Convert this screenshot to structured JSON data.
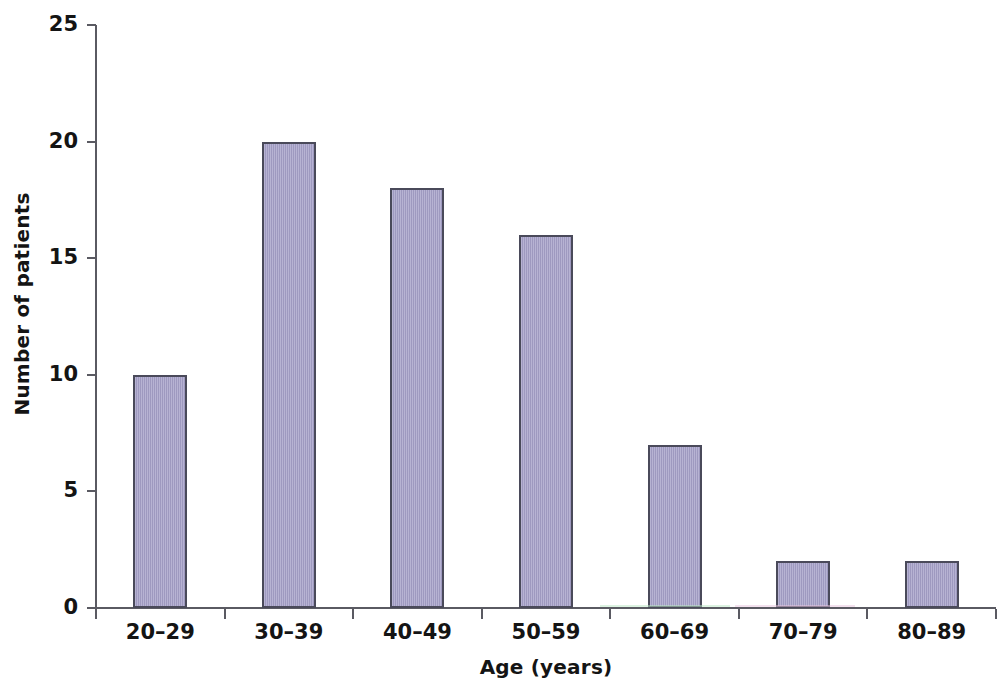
{
  "chart_data": {
    "type": "bar",
    "title": "",
    "xlabel": "Age (years)",
    "ylabel": "Number of patients",
    "categories": [
      "20–29",
      "30–39",
      "40–49",
      "50–59",
      "60–69",
      "70–79",
      "80–89"
    ],
    "values": [
      10,
      20,
      18,
      16,
      7,
      2,
      2
    ],
    "ylim": [
      0,
      25
    ],
    "yticks": [
      0,
      5,
      10,
      15,
      20,
      25
    ],
    "ytick_labels": [
      "0",
      "5",
      "10",
      "15",
      "20",
      "25"
    ],
    "grid": false,
    "legend": null,
    "bar_color": "#a5a0c8",
    "bar_edge_color": "#4a4a5a",
    "axis_color": "#5a5a62",
    "background": "#ffffff"
  }
}
